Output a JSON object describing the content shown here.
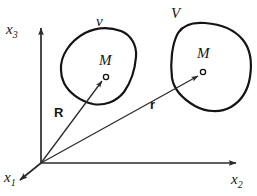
{
  "figure": {
    "background_color": "#ffffff",
    "ink_color": "#161616",
    "axes": {
      "origin_label": "",
      "items": [
        {
          "id": "x3",
          "label": "x",
          "subscript": "3",
          "direction": "up",
          "name": "axis-x3"
        },
        {
          "id": "x2",
          "label": "x",
          "subscript": "2",
          "direction": "right",
          "name": "axis-x2"
        },
        {
          "id": "x1",
          "label": "x",
          "subscript": "1",
          "direction": "down-left",
          "name": "axis-x1"
        }
      ]
    },
    "regions": [
      {
        "id": "v",
        "label": "v",
        "point_label": "M",
        "name": "region-small-v"
      },
      {
        "id": "V",
        "label": "V",
        "point_label": "M",
        "name": "region-large-V"
      }
    ],
    "vectors": [
      {
        "id": "R",
        "label": "R",
        "from": "origin",
        "to": "M in v",
        "name": "vector-R"
      },
      {
        "id": "r",
        "label": "r",
        "from": "origin",
        "to": "M in V",
        "name": "vector-r"
      }
    ]
  }
}
